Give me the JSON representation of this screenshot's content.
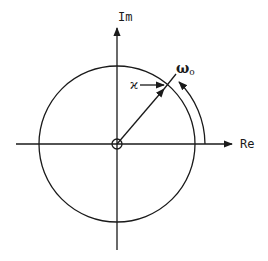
{
  "diagram": {
    "type": "complex-plane",
    "axes": {
      "real_label": "Re",
      "imag_label": "Im"
    },
    "labels": {
      "frequency": "ω",
      "frequency_subscript": "o",
      "radius_marker": "ϰ"
    },
    "colors": {
      "stroke": "#1a1a1a",
      "background": "#ffffff"
    },
    "elements": [
      "unit circle centered at origin",
      "small circle marking origin",
      "radius vector from origin at ~50° to circle",
      "arc arrow from Re axis indicating angle ω_o",
      "arrow from ϰ label pointing to circle"
    ]
  }
}
